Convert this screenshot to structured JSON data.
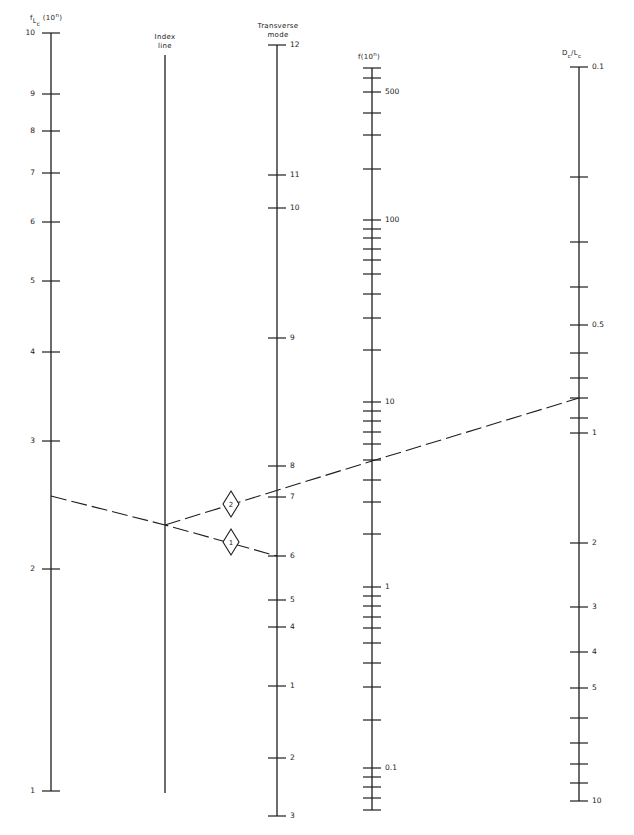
{
  "chart_data": {
    "type": "nomogram",
    "title": "",
    "axes": [
      {
        "id": "f_lc",
        "title": "f_Lc (10^n)",
        "title_parts": {
          "main": "f",
          "sub1": "L",
          "sub2": "c",
          "suffix": "(10",
          "sup": "n",
          "close": ")"
        },
        "x": 51,
        "y_top": 33,
        "y_bottom": 791,
        "label_side": "left",
        "ticks": [
          {
            "label": "10",
            "y": 33
          },
          {
            "label": "9",
            "y": 94
          },
          {
            "label": "8",
            "y": 131
          },
          {
            "label": "7",
            "y": 173
          },
          {
            "label": "6",
            "y": 222
          },
          {
            "label": "5",
            "y": 281
          },
          {
            "label": "4",
            "y": 352
          },
          {
            "label": "3",
            "y": 441
          },
          {
            "label": "2",
            "y": 569
          },
          {
            "label": "1",
            "y": 791
          }
        ]
      },
      {
        "id": "index_line",
        "title": "Index line",
        "title_lines": [
          "Index",
          "line"
        ],
        "x": 165,
        "y_top": 55,
        "y_bottom": 793,
        "ticks": []
      },
      {
        "id": "transverse_mode",
        "title": "Transverse mode",
        "title_lines": [
          "Transverse",
          "mode"
        ],
        "x": 277,
        "y_top": 45,
        "y_bottom": 816,
        "label_side": "right",
        "ticks": [
          {
            "label": "12",
            "y": 45
          },
          {
            "label": "11",
            "y": 175
          },
          {
            "label": "10",
            "y": 208
          },
          {
            "label": "9",
            "y": 338
          },
          {
            "label": "8",
            "y": 466
          },
          {
            "label": "7",
            "y": 497
          },
          {
            "label": "6",
            "y": 556
          },
          {
            "label": "5",
            "y": 600
          },
          {
            "label": "4",
            "y": 627
          },
          {
            "label": "1",
            "y": 686
          },
          {
            "label": "2",
            "y": 758
          },
          {
            "label": "3",
            "y": 816
          }
        ]
      },
      {
        "id": "f",
        "title": "f(10^n)",
        "title_parts": {
          "main": "f(10",
          "sup": "n",
          "close": ")"
        },
        "x": 372,
        "y_top": 68,
        "y_bottom": 810,
        "label_side": "right",
        "ticks": [
          {
            "label": "",
            "y": 68
          },
          {
            "label": "",
            "y": 78
          },
          {
            "label": "500",
            "y": 92
          },
          {
            "label": "",
            "y": 113
          },
          {
            "label": "",
            "y": 135
          },
          {
            "label": "",
            "y": 169
          },
          {
            "label": "100",
            "y": 220
          },
          {
            "label": "",
            "y": 229
          },
          {
            "label": "",
            "y": 238
          },
          {
            "label": "",
            "y": 249
          },
          {
            "label": "",
            "y": 260
          },
          {
            "label": "",
            "y": 274
          },
          {
            "label": "",
            "y": 294
          },
          {
            "label": "",
            "y": 318
          },
          {
            "label": "",
            "y": 350
          },
          {
            "label": "10",
            "y": 402
          },
          {
            "label": "",
            "y": 411
          },
          {
            "label": "",
            "y": 421
          },
          {
            "label": "",
            "y": 432
          },
          {
            "label": "",
            "y": 444
          },
          {
            "label": "",
            "y": 460
          },
          {
            "label": "",
            "y": 480
          },
          {
            "label": "",
            "y": 502
          },
          {
            "label": "",
            "y": 534
          },
          {
            "label": "1",
            "y": 587
          },
          {
            "label": "",
            "y": 596
          },
          {
            "label": "",
            "y": 606
          },
          {
            "label": "",
            "y": 617
          },
          {
            "label": "",
            "y": 628
          },
          {
            "label": "",
            "y": 643
          },
          {
            "label": "",
            "y": 663
          },
          {
            "label": "",
            "y": 687
          },
          {
            "label": "",
            "y": 720
          },
          {
            "label": "0.1",
            "y": 768
          },
          {
            "label": "",
            "y": 777
          },
          {
            "label": "",
            "y": 787
          },
          {
            "label": "",
            "y": 798
          },
          {
            "label": "",
            "y": 810
          }
        ]
      },
      {
        "id": "dc_lc",
        "title": "Dc/Lc",
        "title_parts": {
          "d": "D",
          "dsub": "c",
          "slash": "/",
          "l": "L",
          "lsub": "c"
        },
        "x": 579,
        "y_top": 67,
        "y_bottom": 801,
        "label_side": "right",
        "ticks": [
          {
            "label": "0.1",
            "y": 67
          },
          {
            "label": "",
            "y": 177
          },
          {
            "label": "",
            "y": 242
          },
          {
            "label": "",
            "y": 287
          },
          {
            "label": "0.5",
            "y": 325
          },
          {
            "label": "",
            "y": 353
          },
          {
            "label": "",
            "y": 378
          },
          {
            "label": "",
            "y": 398
          },
          {
            "label": "",
            "y": 418
          },
          {
            "label": "1",
            "y": 433
          },
          {
            "label": "2",
            "y": 543
          },
          {
            "label": "3",
            "y": 607
          },
          {
            "label": "4",
            "y": 652
          },
          {
            "label": "5",
            "y": 688
          },
          {
            "label": "",
            "y": 718
          },
          {
            "label": "",
            "y": 743
          },
          {
            "label": "",
            "y": 764
          },
          {
            "label": "",
            "y": 783
          },
          {
            "label": "10",
            "y": 801
          }
        ]
      }
    ],
    "isopleths": [
      {
        "id": "1",
        "label": "1",
        "from": {
          "axis": "f_lc",
          "x": 51,
          "y": 496
        },
        "pivot": {
          "axis": "index_line",
          "x": 165,
          "y": 525
        },
        "to": {
          "axis": "transverse_mode",
          "x": 277,
          "y": 556
        },
        "marker": {
          "x": 231,
          "y": 542
        }
      },
      {
        "id": "2",
        "label": "2",
        "from": {
          "axis": "index_line",
          "x": 165,
          "y": 525
        },
        "through": {
          "axis": "f",
          "x": 372,
          "y": 461
        },
        "to": {
          "axis": "dc_lc",
          "x": 579,
          "y": 398
        },
        "marker": {
          "x": 231,
          "y": 504
        }
      }
    ],
    "grid": false,
    "legend": "none"
  }
}
